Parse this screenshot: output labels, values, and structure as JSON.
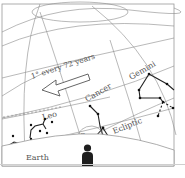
{
  "diagram": {
    "labels": {
      "precession_rate": "1° every 72 years",
      "gemini": "Gemini",
      "cancer": "Cancer",
      "leo": "Leo",
      "sun": "Sun",
      "ecliptic": "Ecliptic",
      "earth": "Earth"
    },
    "icons": {
      "arrow": "left-arrow",
      "observer": "person-silhouette"
    },
    "colors": {
      "grid": "#8a8a8a",
      "constellation": "#222222",
      "observer": "#1e1e1e",
      "frame": "#9a9a9a"
    }
  }
}
